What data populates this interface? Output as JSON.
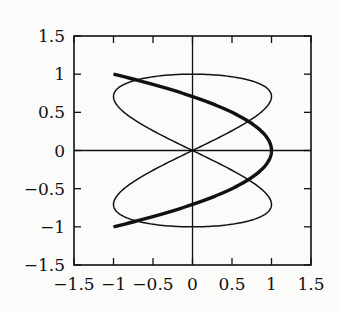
{
  "chart_data": {
    "type": "line",
    "title": "",
    "xlabel": "",
    "ylabel": "",
    "xlim": [
      -1.5,
      1.5
    ],
    "ylim": [
      -1.5,
      1.5
    ],
    "grid": false,
    "legend": null,
    "x_ticks": [
      -1.5,
      -1,
      -0.5,
      0,
      0.5,
      1,
      1.5
    ],
    "x_tick_labels": [
      "−1.5",
      "−1",
      "−0.5",
      "0",
      "0.5",
      "1",
      "1.5"
    ],
    "y_ticks": [
      1.5,
      1,
      0.5,
      0,
      -0.5,
      -1,
      -1.5
    ],
    "y_tick_labels": [
      "1.5",
      "1",
      "0.5",
      "0",
      "−0.5",
      "−1",
      "−1.5"
    ],
    "zero_axes": true,
    "series": [
      {
        "name": "thin figure-eight curve",
        "style": "thin",
        "description": "parametric x = sin(2t), y = sin(t), t in [0, 2π]",
        "x": [
          0,
          0.5,
          0.866,
          1,
          0.866,
          0.5,
          0,
          -0.5,
          -0.866,
          -1,
          -0.866,
          -0.5,
          0,
          0.5,
          0.866,
          1,
          0.866,
          0.5,
          0,
          -0.5,
          -0.866,
          -1,
          -0.866,
          -0.5,
          0
        ],
        "y": [
          0,
          0.259,
          0.5,
          0.707,
          0.866,
          0.966,
          1,
          0.966,
          0.866,
          0.707,
          0.5,
          0.259,
          0,
          -0.259,
          -0.5,
          -0.707,
          -0.866,
          -0.966,
          -1,
          -0.966,
          -0.866,
          -0.707,
          -0.5,
          -0.259,
          0
        ]
      },
      {
        "name": "thick parabola curve",
        "style": "thick",
        "description": "x = 1 - 2y^2, y in [-1, 1]",
        "x": [
          -1,
          -0.62,
          -0.28,
          0,
          0.28,
          0.5,
          0.68,
          0.82,
          0.92,
          0.98,
          1,
          0.98,
          0.92,
          0.82,
          0.68,
          0.5,
          0.28,
          0,
          -0.28,
          -0.62,
          -1
        ],
        "y": [
          1,
          0.9,
          0.8,
          0.707,
          0.6,
          0.5,
          0.4,
          0.3,
          0.2,
          0.1,
          0,
          -0.1,
          -0.2,
          -0.3,
          -0.4,
          -0.5,
          -0.6,
          -0.707,
          -0.8,
          -0.9,
          -1
        ]
      }
    ]
  }
}
